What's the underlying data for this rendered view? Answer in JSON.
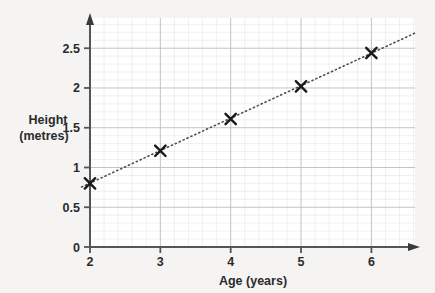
{
  "chart_data": {
    "type": "scatter",
    "title": "",
    "subtitle": "",
    "xlabel": "Age (years)",
    "ylabel_line1": "Height",
    "ylabel_line2": "(metres)",
    "ylabel": "Height (metres)",
    "x": [
      2,
      3,
      4,
      5,
      6
    ],
    "values": [
      0.8,
      1.21,
      1.61,
      2.02,
      2.44
    ],
    "series": [
      {
        "name": "Height measurements",
        "marker": "cross",
        "points": [
          {
            "x": 2,
            "y": 0.8
          },
          {
            "x": 3,
            "y": 1.21
          },
          {
            "x": 4,
            "y": 1.61
          },
          {
            "x": 5,
            "y": 2.02
          },
          {
            "x": 6,
            "y": 2.44
          }
        ]
      },
      {
        "name": "Line of best fit",
        "style": "dotted",
        "endpoints": [
          {
            "x": 1.88,
            "y": 0.755
          },
          {
            "x": 6.62,
            "y": 2.69
          }
        ]
      }
    ],
    "xlim": [
      2,
      6.62
    ],
    "ylim": [
      0,
      2.88
    ],
    "xticks": [
      2,
      3,
      4,
      5,
      6
    ],
    "xtick_labels": [
      "2",
      "3",
      "4",
      "5",
      "6"
    ],
    "yticks": [
      0,
      0.5,
      1,
      1.5,
      2,
      2.5
    ],
    "ytick_labels": [
      "0",
      "0.5",
      "1",
      "1.5",
      "2",
      "2.5"
    ],
    "grid": true,
    "grid_minor_per_major": 5,
    "legend": "none",
    "annotations": []
  },
  "style": {
    "page_background": "#f5f4f3",
    "plot_background": "#ffffff",
    "axis_color": "#555555",
    "grid_major_color": "#b9bdc4",
    "grid_minor_color": "#e2e5ea",
    "marker_color": "#1a1a1a",
    "trendline_color": "#4d4d4d",
    "text_color": "#2b2b2b"
  }
}
